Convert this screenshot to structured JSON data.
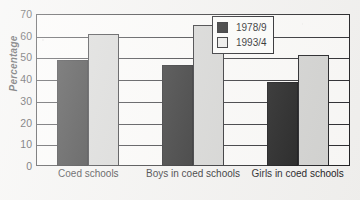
{
  "chart_data": {
    "type": "bar",
    "title": "",
    "xlabel": "",
    "ylabel": "Percentage",
    "ylim": [
      0,
      70
    ],
    "yticks": [
      0,
      10,
      20,
      30,
      40,
      50,
      60,
      70
    ],
    "grid": true,
    "legend_position": "top-right",
    "categories": [
      "Coed schools",
      "Boys in coed schools",
      "Girls in coed schools"
    ],
    "series": [
      {
        "name": "1978/9",
        "color": "#191919",
        "values": [
          49,
          46.5,
          38.5
        ]
      },
      {
        "name": "1993/4",
        "color": "#d2d2d0",
        "values": [
          61,
          65,
          51
        ]
      }
    ]
  },
  "legend": {
    "items": [
      {
        "label": "1978/9"
      },
      {
        "label": "1993/4"
      }
    ]
  },
  "axes": {
    "y_title": "Percentage",
    "y_tick_labels": [
      "70",
      "60",
      "50",
      "40",
      "30",
      "20",
      "10",
      "0"
    ],
    "x_tick_labels": [
      "Coed schools",
      "Boys in coed schools",
      "Girls in coed schools"
    ]
  }
}
